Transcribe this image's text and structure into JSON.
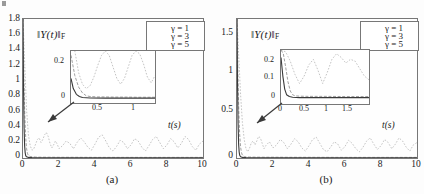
{
  "figure": {
    "corner_mark": "tick-mark",
    "panels": [
      {
        "id": "a",
        "caption": "(a)",
        "norm_label": "‖Y(t)‖",
        "norm_sub": "F",
        "xlabel": "t(s)",
        "legend": [
          {
            "label": "γ = 1",
            "color": "#b9b9b9",
            "dash": "2,2"
          },
          {
            "label": "γ = 3",
            "color": "#8f8f8f",
            "dash": "4,2"
          },
          {
            "label": "γ = 5",
            "color": "#3a3a3a",
            "dash": "0"
          }
        ],
        "inset": {
          "xticks": [
            "0.5",
            "1"
          ],
          "yticks": [
            "0",
            "0.2"
          ],
          "xlim": [
            0.05,
            1.15
          ],
          "ylim": [
            -0.03,
            0.33
          ]
        }
      },
      {
        "id": "b",
        "caption": "(b)",
        "norm_label": "‖Y(t)‖",
        "norm_sub": "F",
        "xlabel": "t(s)",
        "legend": [
          {
            "label": "γ = 1",
            "color": "#b9b9b9",
            "dash": "2,2"
          },
          {
            "label": "γ = 3",
            "color": "#8f8f8f",
            "dash": "4,2"
          },
          {
            "label": "γ = 5",
            "color": "#3a3a3a",
            "dash": "0"
          }
        ],
        "inset": {
          "xticks": [
            "0",
            "0.5",
            "1",
            "1.5"
          ],
          "yticks": [
            "0",
            "0.1",
            "0.2"
          ],
          "xlim": [
            0.0,
            1.9
          ],
          "ylim": [
            -0.03,
            0.26
          ]
        }
      }
    ]
  },
  "chart_data": [
    {
      "type": "line",
      "panel": "a",
      "title": "",
      "xlabel": "t(s)",
      "ylabel": "‖Y(t)‖_F",
      "xlim": [
        0,
        10
      ],
      "ylim": [
        0,
        1.8
      ],
      "xticks": [
        0,
        2,
        4,
        6,
        8,
        10
      ],
      "yticks": [
        0,
        0.2,
        0.4,
        0.6,
        0.8,
        1,
        1.2,
        1.4,
        1.6,
        1.8
      ],
      "xticklabels": [
        "0",
        "2",
        "4",
        "6",
        "8",
        "10"
      ],
      "yticklabels": [
        "0",
        "0.2",
        "0.4",
        "0.6",
        "0.8",
        "1",
        "1.2",
        "1.4",
        "1.6",
        "1.8"
      ],
      "grid": false,
      "legend_position": "upper right",
      "annotation": "arrow pointing from main axes to inset",
      "series": [
        {
          "name": "γ = 1",
          "color": "#b9b9b9",
          "x": [
            0,
            0.1,
            0.2,
            0.3,
            0.4,
            0.5,
            0.6,
            0.7,
            0.8,
            0.9,
            1.0,
            1.1,
            1.2,
            1.3,
            1.4,
            1.5,
            1.6,
            1.7,
            1.8,
            1.9,
            2.0,
            2.2,
            2.4,
            2.6,
            2.8,
            3.0,
            3.2,
            3.4,
            3.6,
            3.8,
            4.0,
            4.2,
            4.4,
            4.6,
            4.8,
            5.0,
            5.2,
            5.4,
            5.6,
            5.8,
            6.0,
            6.2,
            6.4,
            6.6,
            6.8,
            7.0,
            7.2,
            7.4,
            7.6,
            7.8,
            8.0,
            8.2,
            8.4,
            8.6,
            8.8,
            9.0,
            9.2,
            9.4,
            9.6,
            9.8,
            10.0
          ],
          "y": [
            1.8,
            1.2,
            0.62,
            0.3,
            0.16,
            0.1,
            0.12,
            0.18,
            0.24,
            0.26,
            0.2,
            0.24,
            0.3,
            0.33,
            0.28,
            0.19,
            0.13,
            0.17,
            0.22,
            0.18,
            0.12,
            0.16,
            0.22,
            0.19,
            0.12,
            0.2,
            0.26,
            0.21,
            0.14,
            0.1,
            0.18,
            0.27,
            0.3,
            0.22,
            0.13,
            0.09,
            0.15,
            0.23,
            0.2,
            0.12,
            0.17,
            0.25,
            0.22,
            0.14,
            0.09,
            0.16,
            0.24,
            0.28,
            0.2,
            0.12,
            0.17,
            0.25,
            0.21,
            0.13,
            0.19,
            0.28,
            0.24,
            0.15,
            0.1,
            0.18,
            0.22
          ]
        },
        {
          "name": "γ = 3",
          "color": "#8f8f8f",
          "x": [
            0,
            0.05,
            0.1,
            0.15,
            0.2,
            0.25,
            0.3,
            0.4,
            0.5,
            0.7,
            1.0,
            1.5,
            2.0,
            3.0,
            4.0,
            5.0,
            6.0,
            7.0,
            8.0,
            9.0,
            10.0
          ],
          "y": [
            1.8,
            1.05,
            0.55,
            0.26,
            0.12,
            0.06,
            0.03,
            0.02,
            0.015,
            0.012,
            0.01,
            0.01,
            0.009,
            0.009,
            0.008,
            0.008,
            0.008,
            0.008,
            0.008,
            0.008,
            0.008
          ]
        },
        {
          "name": "γ = 5",
          "color": "#3a3a3a",
          "x": [
            0,
            0.03,
            0.06,
            0.09,
            0.12,
            0.15,
            0.2,
            0.3,
            0.5,
            1.0,
            2.0,
            4.0,
            6.0,
            8.0,
            10.0
          ],
          "y": [
            1.8,
            0.9,
            0.4,
            0.16,
            0.07,
            0.03,
            0.015,
            0.008,
            0.005,
            0.004,
            0.004,
            0.004,
            0.004,
            0.004,
            0.004
          ]
        }
      ],
      "inset": {
        "type": "line",
        "xlim": [
          0.05,
          1.15
        ],
        "ylim": [
          -0.03,
          0.33
        ],
        "xticks": [
          0.5,
          1
        ],
        "yticks": [
          0,
          0.2
        ],
        "xticklabels": [
          "0.5",
          "1"
        ],
        "yticklabels": [
          "0",
          "0.2"
        ],
        "series": [
          {
            "name": "γ = 1",
            "color": "#b9b9b9",
            "x": [
              0.05,
              0.1,
              0.15,
              0.2,
              0.25,
              0.3,
              0.35,
              0.4,
              0.45,
              0.5,
              0.55,
              0.6,
              0.65,
              0.7,
              0.75,
              0.8,
              0.85,
              0.9,
              0.95,
              1.0,
              1.05,
              1.1,
              1.15
            ],
            "y": [
              0.62,
              0.33,
              0.18,
              0.1,
              0.07,
              0.09,
              0.15,
              0.23,
              0.3,
              0.33,
              0.3,
              0.22,
              0.14,
              0.1,
              0.14,
              0.22,
              0.3,
              0.33,
              0.31,
              0.24,
              0.15,
              0.11,
              0.16
            ]
          },
          {
            "name": "γ = 3",
            "color": "#8f8f8f",
            "x": [
              0.05,
              0.1,
              0.15,
              0.2,
              0.25,
              0.3,
              0.4,
              0.5,
              0.6,
              0.7,
              0.8,
              0.9,
              1.0,
              1.15
            ],
            "y": [
              0.3,
              0.16,
              0.08,
              0.04,
              0.02,
              0.015,
              0.012,
              0.012,
              0.011,
              0.011,
              0.011,
              0.01,
              0.01,
              0.01
            ]
          },
          {
            "name": "γ = 5",
            "color": "#3a3a3a",
            "x": [
              0.05,
              0.08,
              0.12,
              0.16,
              0.2,
              0.3,
              0.5,
              0.8,
              1.15
            ],
            "y": [
              0.14,
              0.07,
              0.03,
              0.015,
              0.008,
              0.005,
              0.004,
              0.004,
              0.004
            ]
          }
        ]
      }
    },
    {
      "type": "line",
      "panel": "b",
      "title": "",
      "xlabel": "t(s)",
      "ylabel": "‖Y(t)‖_F",
      "xlim": [
        0,
        10
      ],
      "ylim": [
        0,
        1.8
      ],
      "xticks": [
        0,
        2,
        4,
        6,
        8,
        10
      ],
      "yticks": [
        0,
        0.5,
        1,
        1.5
      ],
      "xticklabels": [
        "0",
        "2",
        "4",
        "6",
        "8",
        "10"
      ],
      "yticklabels": [
        "0",
        "0.5",
        "1",
        "1.5"
      ],
      "grid": false,
      "legend_position": "upper right",
      "annotation": "arrow pointing from main axes to inset",
      "series": [
        {
          "name": "γ = 1",
          "color": "#b9b9b9",
          "x": [
            0,
            0.1,
            0.2,
            0.3,
            0.4,
            0.5,
            0.6,
            0.7,
            0.8,
            0.9,
            1.0,
            1.1,
            1.2,
            1.3,
            1.4,
            1.5,
            1.6,
            1.8,
            2.0,
            2.2,
            2.4,
            2.6,
            2.8,
            3.0,
            3.2,
            3.4,
            3.6,
            3.8,
            4.0,
            4.2,
            4.4,
            4.6,
            4.8,
            5.0,
            5.2,
            5.4,
            5.6,
            5.8,
            6.0,
            6.2,
            6.4,
            6.6,
            6.8,
            7.0,
            7.2,
            7.4,
            7.6,
            7.8,
            8.0,
            8.2,
            8.4,
            8.6,
            8.8,
            9.0,
            9.2,
            9.4,
            9.6,
            9.8,
            10.0
          ],
          "y": [
            1.8,
            1.3,
            0.82,
            0.46,
            0.24,
            0.12,
            0.08,
            0.13,
            0.2,
            0.22,
            0.17,
            0.22,
            0.28,
            0.26,
            0.19,
            0.12,
            0.16,
            0.21,
            0.13,
            0.17,
            0.24,
            0.2,
            0.12,
            0.18,
            0.25,
            0.21,
            0.13,
            0.09,
            0.16,
            0.24,
            0.27,
            0.19,
            0.11,
            0.08,
            0.14,
            0.21,
            0.18,
            0.1,
            0.15,
            0.23,
            0.19,
            0.12,
            0.08,
            0.14,
            0.22,
            0.26,
            0.18,
            0.11,
            0.16,
            0.24,
            0.2,
            0.12,
            0.18,
            0.26,
            0.22,
            0.14,
            0.09,
            0.17,
            0.2
          ]
        },
        {
          "name": "γ = 3",
          "color": "#8f8f8f",
          "x": [
            0,
            0.05,
            0.1,
            0.15,
            0.2,
            0.25,
            0.3,
            0.4,
            0.5,
            0.7,
            1.0,
            1.5,
            2.0,
            3.0,
            4.0,
            6.0,
            8.0,
            10.0
          ],
          "y": [
            1.8,
            1.1,
            0.6,
            0.3,
            0.14,
            0.07,
            0.035,
            0.018,
            0.014,
            0.012,
            0.011,
            0.01,
            0.01,
            0.009,
            0.009,
            0.008,
            0.008,
            0.008
          ]
        },
        {
          "name": "γ = 5",
          "color": "#3a3a3a",
          "x": [
            0,
            0.03,
            0.06,
            0.09,
            0.12,
            0.15,
            0.2,
            0.3,
            0.5,
            1.0,
            2.0,
            4.0,
            6.0,
            8.0,
            10.0
          ],
          "y": [
            1.8,
            0.95,
            0.45,
            0.18,
            0.08,
            0.035,
            0.016,
            0.008,
            0.005,
            0.004,
            0.004,
            0.004,
            0.004,
            0.004,
            0.004
          ]
        }
      ],
      "inset": {
        "type": "line",
        "xlim": [
          0.0,
          1.9
        ],
        "ylim": [
          -0.03,
          0.26
        ],
        "xticks": [
          0,
          0.5,
          1,
          1.5
        ],
        "yticks": [
          0,
          0.1,
          0.2
        ],
        "xticklabels": [
          "0",
          "0.5",
          "1",
          "1.5"
        ],
        "yticklabels": [
          "0",
          "0.1",
          "0.2"
        ],
        "series": [
          {
            "name": "γ = 1",
            "color": "#b9b9b9",
            "x": [
              0.0,
              0.1,
              0.2,
              0.3,
              0.4,
              0.5,
              0.6,
              0.7,
              0.8,
              0.9,
              1.0,
              1.1,
              1.2,
              1.3,
              1.4,
              1.5,
              1.6,
              1.7,
              1.8,
              1.9
            ],
            "y": [
              0.26,
              0.25,
              0.2,
              0.13,
              0.08,
              0.12,
              0.18,
              0.21,
              0.15,
              0.08,
              0.14,
              0.21,
              0.24,
              0.22,
              0.19,
              0.21,
              0.2,
              0.16,
              0.12,
              0.1
            ]
          },
          {
            "name": "γ = 3",
            "color": "#8f8f8f",
            "x": [
              0.0,
              0.05,
              0.1,
              0.15,
              0.2,
              0.25,
              0.3,
              0.4,
              0.6,
              1.0,
              1.4,
              1.9
            ],
            "y": [
              0.26,
              0.24,
              0.17,
              0.09,
              0.04,
              0.02,
              0.014,
              0.012,
              0.011,
              0.011,
              0.01,
              0.01
            ]
          },
          {
            "name": "γ = 5",
            "color": "#3a3a3a",
            "x": [
              0.0,
              0.04,
              0.08,
              0.12,
              0.18,
              0.25,
              0.4,
              0.8,
              1.4,
              1.9
            ],
            "y": [
              0.22,
              0.12,
              0.05,
              0.02,
              0.01,
              0.006,
              0.004,
              0.004,
              0.004,
              0.004
            ]
          }
        ]
      }
    }
  ]
}
